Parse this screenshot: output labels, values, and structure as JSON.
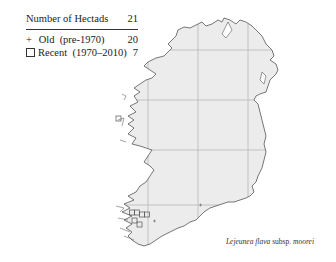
{
  "legend": {
    "header_label": "Number of Hectads",
    "header_value": "21",
    "rows": [
      {
        "symbol": "+",
        "label": "Old  (pre-1970)",
        "value": "20"
      },
      {
        "symbol": "square",
        "label": "Recent  (1970–2010)",
        "value": "7"
      }
    ]
  },
  "map": {
    "region": "Ireland",
    "land_fill": "#ececec",
    "coast_color": "#555555",
    "grid_color": "#b8b8b8",
    "grid_x": [
      148,
      198,
      248
    ],
    "grid_y": [
      50,
      100,
      150,
      205
    ]
  },
  "caption": {
    "genus_species": "Lejeunea flava",
    "rank": "subsp.",
    "infraspecific": "moorei"
  }
}
